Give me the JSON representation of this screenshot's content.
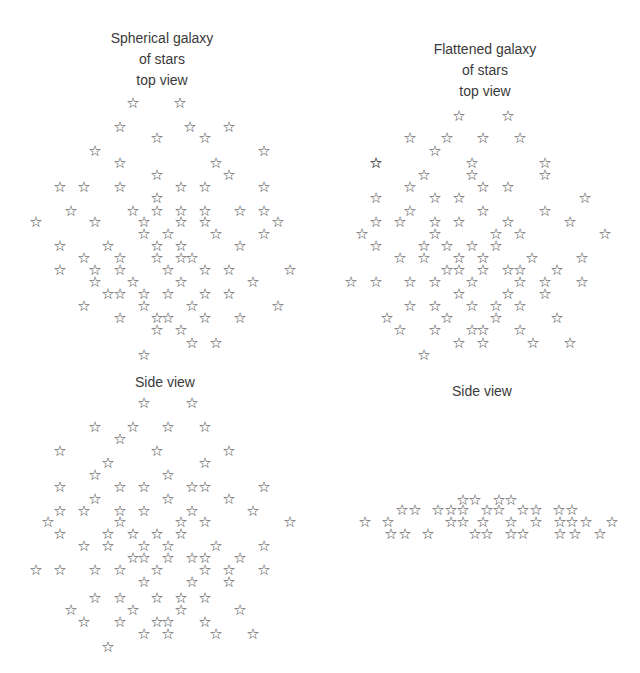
{
  "panels": [
    {
      "id": "spherical-top",
      "title_lines": [
        "Spherical galaxy",
        "of stars",
        "top view"
      ],
      "glyph": "☆",
      "stars": [
        [
          133,
          103
        ],
        [
          180,
          103
        ],
        [
          120,
          127
        ],
        [
          190,
          127
        ],
        [
          229,
          127
        ],
        [
          157,
          138
        ],
        [
          205,
          138
        ],
        [
          95,
          151
        ],
        [
          264,
          151
        ],
        [
          120,
          163
        ],
        [
          216,
          163
        ],
        [
          157,
          175
        ],
        [
          229,
          175
        ],
        [
          60,
          187
        ],
        [
          84,
          187
        ],
        [
          120,
          187
        ],
        [
          181,
          187
        ],
        [
          205,
          187
        ],
        [
          264,
          187
        ],
        [
          157,
          198
        ],
        [
          71,
          211
        ],
        [
          133,
          211
        ],
        [
          157,
          211
        ],
        [
          181,
          211
        ],
        [
          205,
          211
        ],
        [
          240,
          211
        ],
        [
          264,
          211
        ],
        [
          36,
          222
        ],
        [
          95,
          222
        ],
        [
          144,
          222
        ],
        [
          181,
          222
        ],
        [
          205,
          222
        ],
        [
          278,
          222
        ],
        [
          144,
          234
        ],
        [
          168,
          234
        ],
        [
          216,
          234
        ],
        [
          264,
          234
        ],
        [
          60,
          246
        ],
        [
          108,
          246
        ],
        [
          157,
          246
        ],
        [
          181,
          246
        ],
        [
          240,
          246
        ],
        [
          84,
          258
        ],
        [
          120,
          258
        ],
        [
          157,
          258
        ],
        [
          181,
          258
        ],
        [
          192,
          258
        ],
        [
          60,
          270
        ],
        [
          95,
          270
        ],
        [
          120,
          270
        ],
        [
          168,
          270
        ],
        [
          205,
          270
        ],
        [
          229,
          270
        ],
        [
          290,
          270
        ],
        [
          95,
          282
        ],
        [
          133,
          282
        ],
        [
          181,
          282
        ],
        [
          253,
          282
        ],
        [
          108,
          294
        ],
        [
          120,
          294
        ],
        [
          144,
          294
        ],
        [
          168,
          294
        ],
        [
          205,
          294
        ],
        [
          229,
          294
        ],
        [
          84,
          306
        ],
        [
          144,
          306
        ],
        [
          192,
          306
        ],
        [
          278,
          306
        ],
        [
          120,
          318
        ],
        [
          157,
          318
        ],
        [
          168,
          318
        ],
        [
          205,
          318
        ],
        [
          240,
          318
        ],
        [
          157,
          330
        ],
        [
          181,
          330
        ],
        [
          192,
          343
        ],
        [
          216,
          343
        ],
        [
          144,
          355
        ]
      ]
    },
    {
      "id": "flattened-top",
      "title_lines": [
        "Flattened galaxy",
        "of stars",
        "top view"
      ],
      "glyph": "☆",
      "stars": [
        [
          459,
          116
        ],
        [
          508,
          116
        ],
        [
          410,
          138
        ],
        [
          447,
          138
        ],
        [
          483,
          138
        ],
        [
          520,
          138
        ],
        [
          435,
          151
        ],
        [
          376,
          163
        ],
        [
          472,
          163
        ],
        [
          545,
          163
        ],
        [
          376,
          163
        ],
        [
          424,
          175
        ],
        [
          472,
          175
        ],
        [
          545,
          175
        ],
        [
          410,
          187
        ],
        [
          483,
          187
        ],
        [
          508,
          187
        ],
        [
          585,
          198
        ],
        [
          376,
          198
        ],
        [
          435,
          198
        ],
        [
          459,
          198
        ],
        [
          410,
          211
        ],
        [
          483,
          211
        ],
        [
          545,
          211
        ],
        [
          376,
          222
        ],
        [
          400,
          222
        ],
        [
          435,
          222
        ],
        [
          459,
          222
        ],
        [
          508,
          222
        ],
        [
          570,
          222
        ],
        [
          362,
          234
        ],
        [
          435,
          234
        ],
        [
          496,
          234
        ],
        [
          520,
          234
        ],
        [
          605,
          234
        ],
        [
          376,
          246
        ],
        [
          424,
          246
        ],
        [
          447,
          246
        ],
        [
          472,
          246
        ],
        [
          496,
          246
        ],
        [
          400,
          258
        ],
        [
          424,
          258
        ],
        [
          459,
          258
        ],
        [
          483,
          258
        ],
        [
          532,
          258
        ],
        [
          582,
          258
        ],
        [
          447,
          270
        ],
        [
          459,
          270
        ],
        [
          483,
          270
        ],
        [
          508,
          270
        ],
        [
          520,
          270
        ],
        [
          557,
          270
        ],
        [
          351,
          282
        ],
        [
          376,
          282
        ],
        [
          410,
          282
        ],
        [
          435,
          282
        ],
        [
          472,
          282
        ],
        [
          520,
          282
        ],
        [
          545,
          282
        ],
        [
          582,
          282
        ],
        [
          459,
          294
        ],
        [
          508,
          294
        ],
        [
          545,
          294
        ],
        [
          410,
          306
        ],
        [
          435,
          306
        ],
        [
          472,
          306
        ],
        [
          496,
          306
        ],
        [
          520,
          306
        ],
        [
          387,
          318
        ],
        [
          447,
          318
        ],
        [
          496,
          318
        ],
        [
          557,
          318
        ],
        [
          400,
          330
        ],
        [
          435,
          330
        ],
        [
          472,
          330
        ],
        [
          483,
          330
        ],
        [
          520,
          330
        ],
        [
          459,
          343
        ],
        [
          483,
          343
        ],
        [
          533,
          343
        ],
        [
          570,
          343
        ],
        [
          424,
          355
        ]
      ]
    },
    {
      "id": "spherical-side",
      "title_lines": [
        "Side view"
      ],
      "glyph": "☆",
      "stars": [
        [
          144,
          403
        ],
        [
          192,
          403
        ],
        [
          95,
          427
        ],
        [
          133,
          427
        ],
        [
          168,
          427
        ],
        [
          205,
          427
        ],
        [
          120,
          439
        ],
        [
          60,
          451
        ],
        [
          157,
          451
        ],
        [
          229,
          451
        ],
        [
          108,
          463
        ],
        [
          205,
          463
        ],
        [
          95,
          475
        ],
        [
          168,
          475
        ],
        [
          60,
          487
        ],
        [
          120,
          487
        ],
        [
          144,
          487
        ],
        [
          192,
          487
        ],
        [
          205,
          487
        ],
        [
          264,
          487
        ],
        [
          95,
          499
        ],
        [
          168,
          499
        ],
        [
          229,
          499
        ],
        [
          60,
          511
        ],
        [
          84,
          511
        ],
        [
          120,
          511
        ],
        [
          144,
          511
        ],
        [
          192,
          511
        ],
        [
          253,
          511
        ],
        [
          48,
          522
        ],
        [
          120,
          522
        ],
        [
          181,
          522
        ],
        [
          205,
          522
        ],
        [
          290,
          522
        ],
        [
          60,
          534
        ],
        [
          108,
          534
        ],
        [
          133,
          534
        ],
        [
          157,
          534
        ],
        [
          181,
          534
        ],
        [
          84,
          546
        ],
        [
          108,
          546
        ],
        [
          144,
          546
        ],
        [
          168,
          546
        ],
        [
          216,
          546
        ],
        [
          264,
          546
        ],
        [
          133,
          558
        ],
        [
          144,
          558
        ],
        [
          168,
          558
        ],
        [
          192,
          558
        ],
        [
          205,
          558
        ],
        [
          240,
          558
        ],
        [
          36,
          570
        ],
        [
          60,
          570
        ],
        [
          95,
          570
        ],
        [
          120,
          570
        ],
        [
          157,
          570
        ],
        [
          205,
          570
        ],
        [
          229,
          570
        ],
        [
          264,
          570
        ],
        [
          144,
          582
        ],
        [
          192,
          582
        ],
        [
          229,
          582
        ],
        [
          95,
          598
        ],
        [
          120,
          598
        ],
        [
          157,
          598
        ],
        [
          181,
          598
        ],
        [
          205,
          598
        ],
        [
          71,
          610
        ],
        [
          133,
          610
        ],
        [
          181,
          610
        ],
        [
          240,
          610
        ],
        [
          84,
          622
        ],
        [
          120,
          622
        ],
        [
          157,
          622
        ],
        [
          168,
          622
        ],
        [
          205,
          622
        ],
        [
          144,
          634
        ],
        [
          168,
          634
        ],
        [
          216,
          634
        ],
        [
          253,
          634
        ],
        [
          108,
          647
        ]
      ]
    },
    {
      "id": "flattened-side",
      "title_lines": [
        "Side view"
      ],
      "glyph": "☆",
      "stars": [
        [
          463,
          500
        ],
        [
          475,
          500
        ],
        [
          499,
          500
        ],
        [
          511,
          500
        ],
        [
          402,
          510
        ],
        [
          415,
          510
        ],
        [
          438,
          510
        ],
        [
          451,
          510
        ],
        [
          463,
          510
        ],
        [
          487,
          510
        ],
        [
          499,
          510
        ],
        [
          523,
          510
        ],
        [
          536,
          510
        ],
        [
          559,
          510
        ],
        [
          572,
          510
        ],
        [
          365,
          522
        ],
        [
          388,
          522
        ],
        [
          451,
          522
        ],
        [
          463,
          522
        ],
        [
          483,
          522
        ],
        [
          511,
          522
        ],
        [
          536,
          522
        ],
        [
          560,
          522
        ],
        [
          572,
          522
        ],
        [
          586,
          522
        ],
        [
          612,
          522
        ],
        [
          391,
          534
        ],
        [
          405,
          534
        ],
        [
          428,
          534
        ],
        [
          475,
          534
        ],
        [
          487,
          534
        ],
        [
          511,
          534
        ],
        [
          523,
          534
        ],
        [
          560,
          534
        ],
        [
          575,
          534
        ],
        [
          600,
          534
        ]
      ]
    }
  ]
}
